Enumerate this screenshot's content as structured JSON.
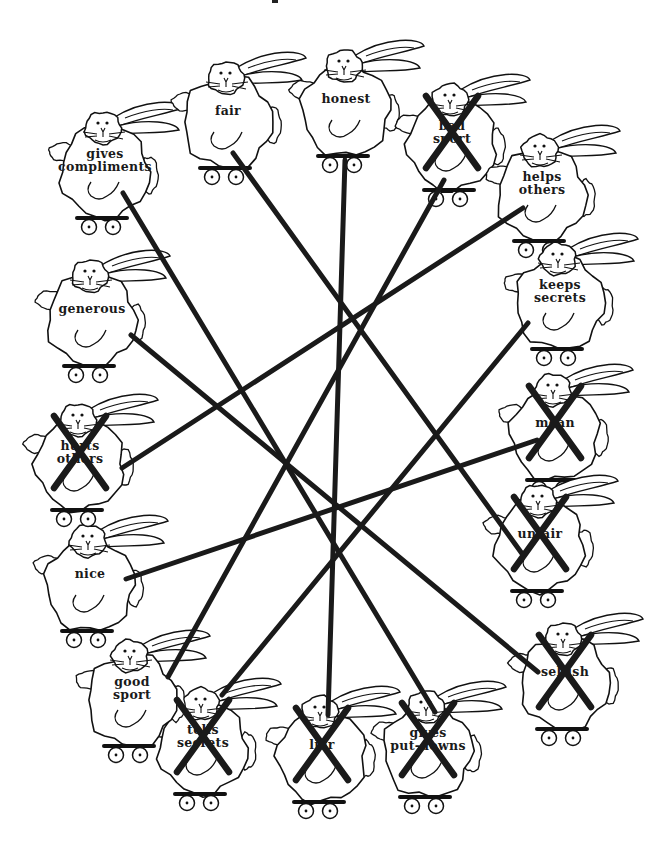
{
  "worksheet": {
    "description": "Ring of bunnies on roller skates, each labeled with a trait; lines connect opposite traits and negative traits are crossed out",
    "colors": {
      "ink": "#1a1a1a",
      "paper": "#ffffff"
    }
  },
  "bunnies": [
    {
      "id": "gives-compliments",
      "label": [
        "gives",
        "compliments"
      ],
      "crossed": false,
      "x": 105,
      "y": 160
    },
    {
      "id": "fair",
      "label": [
        "fair"
      ],
      "crossed": false,
      "x": 228,
      "y": 110
    },
    {
      "id": "honest",
      "label": [
        "honest"
      ],
      "crossed": false,
      "x": 346,
      "y": 98
    },
    {
      "id": "bad-sport",
      "label": [
        "bad",
        "sport"
      ],
      "crossed": true,
      "x": 452,
      "y": 132
    },
    {
      "id": "helps-others",
      "label": [
        "helps",
        "others"
      ],
      "crossed": false,
      "x": 542,
      "y": 183
    },
    {
      "id": "keeps-secrets",
      "label": [
        "keeps",
        "secrets"
      ],
      "crossed": false,
      "x": 560,
      "y": 291
    },
    {
      "id": "mean",
      "label": [
        "mean"
      ],
      "crossed": true,
      "x": 555,
      "y": 422
    },
    {
      "id": "unfair",
      "label": [
        "unfair"
      ],
      "crossed": true,
      "x": 540,
      "y": 533
    },
    {
      "id": "selfish",
      "label": [
        "selfish"
      ],
      "crossed": true,
      "x": 565,
      "y": 671
    },
    {
      "id": "gives-put-downs",
      "label": [
        "gives",
        "put-downs"
      ],
      "crossed": true,
      "x": 428,
      "y": 739
    },
    {
      "id": "liar",
      "label": [
        "liar"
      ],
      "crossed": true,
      "x": 322,
      "y": 744
    },
    {
      "id": "tells-secrets",
      "label": [
        "tells",
        "secrets"
      ],
      "crossed": true,
      "x": 203,
      "y": 736
    },
    {
      "id": "good-sport",
      "label": [
        "good",
        "sport"
      ],
      "crossed": false,
      "x": 132,
      "y": 688
    },
    {
      "id": "nice",
      "label": [
        "nice"
      ],
      "crossed": false,
      "x": 90,
      "y": 573
    },
    {
      "id": "hurts-others",
      "label": [
        "hurts",
        "others"
      ],
      "crossed": true,
      "x": 80,
      "y": 452
    },
    {
      "id": "generous",
      "label": [
        "generous"
      ],
      "crossed": false,
      "x": 92,
      "y": 308
    }
  ],
  "connections": [
    {
      "from": "gives-compliments",
      "to": "gives-put-downs",
      "x1": 123,
      "y1": 193,
      "x2": 435,
      "y2": 712
    },
    {
      "from": "fair",
      "to": "unfair",
      "x1": 233,
      "y1": 153,
      "x2": 523,
      "y2": 555
    },
    {
      "from": "honest",
      "to": "liar",
      "x1": 345,
      "y1": 160,
      "x2": 328,
      "y2": 715
    },
    {
      "from": "helps-others",
      "to": "hurts-others",
      "x1": 523,
      "y1": 208,
      "x2": 122,
      "y2": 468
    },
    {
      "from": "keeps-secrets",
      "to": "tells-secrets",
      "x1": 528,
      "y1": 323,
      "x2": 222,
      "y2": 695
    },
    {
      "from": "generous",
      "to": "selfish",
      "x1": 131,
      "y1": 335,
      "x2": 538,
      "y2": 672
    },
    {
      "from": "nice",
      "to": "mean",
      "x1": 126,
      "y1": 579,
      "x2": 537,
      "y2": 440
    },
    {
      "from": "good-sport",
      "to": "bad-sport",
      "x1": 168,
      "y1": 677,
      "x2": 444,
      "y2": 180
    }
  ]
}
